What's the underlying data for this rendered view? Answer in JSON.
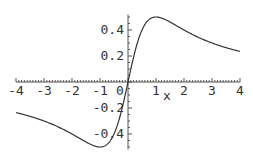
{
  "chart_data": {
    "type": "line",
    "title": "",
    "xlabel": "x",
    "ylabel": "",
    "xlim": [
      -4,
      4
    ],
    "ylim": [
      -0.52,
      0.52
    ],
    "grid": false,
    "legend": null,
    "x_ticks": [
      "-4",
      "-3",
      "-2",
      "-1",
      "0",
      "1",
      "2",
      "3",
      "4"
    ],
    "y_ticks": [
      "-0.4",
      "-0.2",
      "0.2",
      "0.4"
    ],
    "series": [
      {
        "name": "x/(1+x^2)",
        "x": [
          -4,
          -3.5,
          -3,
          -2.5,
          -2,
          -1.5,
          -1,
          -0.75,
          -0.5,
          -0.25,
          0,
          0.25,
          0.5,
          0.75,
          1,
          1.5,
          2,
          2.5,
          3,
          3.5,
          4
        ],
        "values": [
          -0.235,
          -0.264,
          -0.3,
          -0.345,
          -0.4,
          -0.462,
          -0.5,
          -0.48,
          -0.4,
          -0.235,
          0,
          0.235,
          0.4,
          0.48,
          0.5,
          0.462,
          0.4,
          0.345,
          0.3,
          0.264,
          0.235
        ]
      }
    ]
  },
  "axis": {
    "x_label": "x",
    "origin_label": "0"
  },
  "colors": {
    "curve": "#333333",
    "axis": "#555555"
  }
}
